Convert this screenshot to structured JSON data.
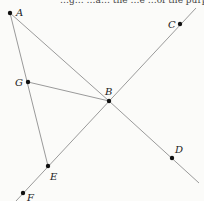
{
  "diagram": {
    "top_caption_fragment": "…g… …a… the …e …of the purpo…",
    "points": [
      {
        "name": "A",
        "x": 10,
        "y": 13,
        "lx": 16,
        "ly": 16
      },
      {
        "name": "B",
        "x": 109,
        "y": 101,
        "lx": 105,
        "ly": 95
      },
      {
        "name": "C",
        "x": 180,
        "y": 24,
        "lx": 168,
        "ly": 28
      },
      {
        "name": "D",
        "x": 172,
        "y": 158,
        "lx": 175,
        "ly": 153
      },
      {
        "name": "E",
        "x": 48,
        "y": 166,
        "lx": 50,
        "ly": 180
      },
      {
        "name": "F",
        "x": 23,
        "y": 193,
        "lx": 27,
        "ly": 201
      },
      {
        "name": "G",
        "x": 28,
        "y": 82,
        "lx": 15,
        "ly": 86
      }
    ],
    "segments": [
      {
        "from": "A",
        "to": "E"
      },
      {
        "from": "A",
        "to": "B"
      },
      {
        "from": "G",
        "to": "B"
      },
      {
        "label": "line through F, E, B, C",
        "x1": 16,
        "y1": 201,
        "x2": 196,
        "y2": 8
      },
      {
        "label": "ray B through D",
        "x1": 109,
        "y1": 101,
        "x2": 199,
        "y2": 183
      }
    ]
  }
}
